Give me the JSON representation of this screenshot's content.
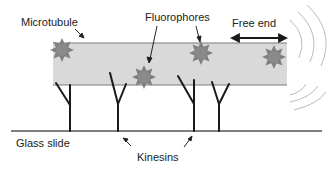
{
  "diagram": {
    "labels": {
      "microtubule": "Microtubule",
      "fluorophores": "Fluorophores",
      "free_end": "Free end",
      "glass_slide": "Glass slide",
      "kinesins": "Kinesins"
    },
    "colors": {
      "microtubule_fill": "#d9d9d9",
      "microtubule_border": "#7a7a7a",
      "fluorophore": "#808080",
      "kinesin": "#1a1a1a",
      "slide": "#555555",
      "motion_arcs": "#bbbbbb"
    }
  }
}
